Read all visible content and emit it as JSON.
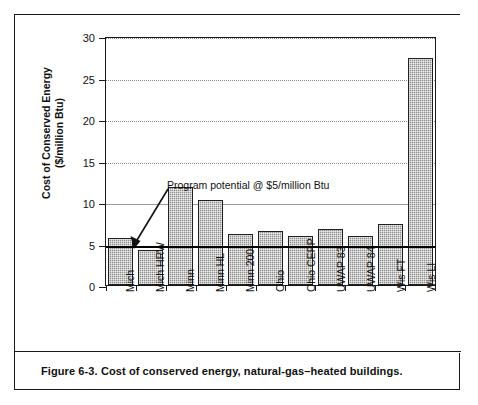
{
  "figure": {
    "caption": "Figure 6-3.  Cost of conserved energy, natural-gas–heated buildings.",
    "annotation": "Program potential @ $5/million Btu"
  },
  "chart_data": {
    "type": "bar",
    "title": "",
    "xlabel": "",
    "ylabel": "Cost of Conserved Energy ($/million Btu)",
    "ylabel_line1": "Cost of Conserved Energy",
    "ylabel_line2": "($/million Btu)",
    "ylim": [
      0,
      30
    ],
    "yticks": [
      0,
      5,
      10,
      15,
      20,
      25,
      30
    ],
    "ytick_labels": [
      "0",
      "5",
      "10",
      "15",
      "20",
      "25",
      "30"
    ],
    "grid": true,
    "legend": "none",
    "categories": [
      "Mich",
      "Mich HRW",
      "Minn",
      "Minn HL",
      "Minn 200",
      "Ohio",
      "Ohio CEPP",
      "UWAP 83",
      "UWAP 84",
      "Wis FT",
      "Wis LI"
    ],
    "values": [
      5.7,
      4.2,
      11.8,
      10.3,
      6.1,
      6.5,
      5.9,
      6.8,
      5.9,
      7.3,
      27.4
    ],
    "threshold_line": {
      "value": 5,
      "label": "Program potential @ $5/million Btu"
    },
    "bar_color": "#8e8e8e",
    "bar_edge_color": "#1f1f1f",
    "threshold_color": "#000000"
  }
}
